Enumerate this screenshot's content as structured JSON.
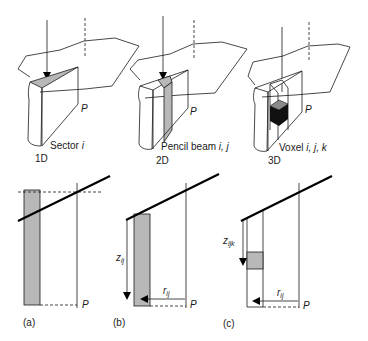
{
  "figure": {
    "colors": {
      "line": "#1a1a1a",
      "shade": "#b8b8b8",
      "voxel_dark": "#111111",
      "voxel_top": "#8a8a8a",
      "background": "#ffffff"
    },
    "top_panels": [
      {
        "id": "sector",
        "element_label": "Sector ",
        "element_index": "i",
        "dimension": "1D",
        "point_label": "P"
      },
      {
        "id": "pencil-beam",
        "element_label": "Pencil beam ",
        "element_index": "i, j",
        "dimension": "2D",
        "point_label": "P"
      },
      {
        "id": "voxel",
        "element_label": "Voxel ",
        "element_index": "i, j, k",
        "dimension": "3D",
        "point_label": "P"
      }
    ],
    "bottom_panels": [
      {
        "id": "a",
        "caption": "(a)",
        "point_label": "P"
      },
      {
        "id": "b",
        "caption": "(b)",
        "point_label": "P",
        "depth_label": "z",
        "depth_sub": "ij",
        "radius_label": "r",
        "radius_sub": "ij"
      },
      {
        "id": "c",
        "caption": "(c)",
        "point_label": "P",
        "depth_label": "z",
        "depth_sub": "ijk",
        "radius_label": "r",
        "radius_sub": "ij"
      }
    ]
  }
}
